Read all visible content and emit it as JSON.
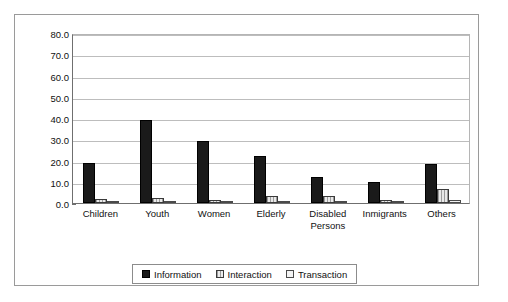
{
  "chart_data": {
    "type": "bar",
    "title": "",
    "subtitle": "",
    "xlabel": "",
    "ylabel": "",
    "ylim": [
      0,
      80
    ],
    "ytick_step": 10,
    "ytick_labels": [
      "0.0",
      "10.0",
      "20.0",
      "30.0",
      "40.0",
      "50.0",
      "60.0",
      "70.0",
      "80.0"
    ],
    "grid": true,
    "legend_position": "bottom-center",
    "categories": [
      "Children",
      "Youth",
      "Women",
      "Elderly",
      "Disabled\nPersons",
      "Inmigrants",
      "Others"
    ],
    "series": [
      {
        "name": "Information",
        "color": "#1a1a1a",
        "values": [
          19.0,
          39.3,
          29.0,
          22.0,
          12.3,
          10.0,
          18.5
        ]
      },
      {
        "name": "Interaction",
        "color": "#9d9d9d",
        "values": [
          2.0,
          2.4,
          1.4,
          3.4,
          3.4,
          1.6,
          6.6
        ]
      },
      {
        "name": "Transaction",
        "color": "#f2f2f2",
        "values": [
          0.9,
          1.0,
          0.8,
          0.9,
          1.0,
          0.8,
          1.3
        ]
      }
    ]
  }
}
